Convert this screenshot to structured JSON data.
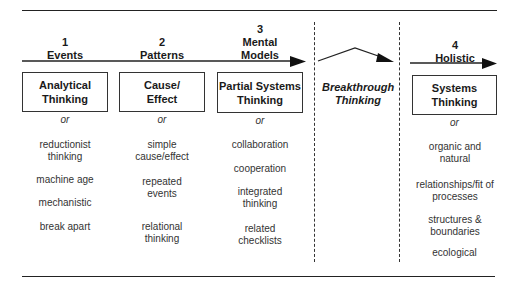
{
  "columns": [
    {
      "number": "1",
      "heading": "Events",
      "box_label": "Analytical Thinking",
      "connector": "or",
      "items": [
        "reductionist thinking",
        "machine age",
        "mechanistic",
        "break apart"
      ]
    },
    {
      "number": "2",
      "heading": "Patterns",
      "box_label": "Cause/ Effect",
      "connector": "or",
      "items": [
        "simple cause/effect",
        "repeated events",
        "relational thinking"
      ]
    },
    {
      "number": "3",
      "heading": "Mental Models",
      "box_label": "Partial Systems Thinking",
      "connector": "or",
      "items": [
        "collaboration",
        "cooperation",
        "integrated thinking",
        "related checklists"
      ]
    },
    {
      "number": "4",
      "heading": "Holistic",
      "box_label": "Systems Thinking",
      "connector": "or",
      "items": [
        "organic and natural",
        "relationships/fit of processes",
        "structures & boundaries",
        "ecological"
      ]
    }
  ],
  "breakthrough": {
    "label": "Breakthrough Thinking"
  },
  "colors": {
    "line": "#222222",
    "text": "#1a1a1a",
    "background": "#ffffff"
  }
}
